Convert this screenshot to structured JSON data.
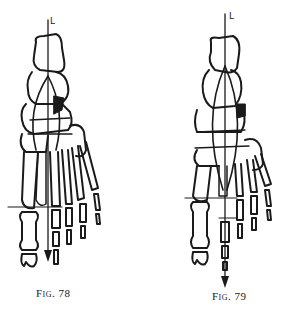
{
  "figures": [
    {
      "id": "left",
      "caption": "Fig. 78",
      "axis_label": "L",
      "subject": "foot-skeleton-dorsal-view"
    },
    {
      "id": "right",
      "caption": "Fig. 79",
      "axis_label": "L",
      "subject": "foot-skeleton-dorsal-view"
    }
  ],
  "colors": {
    "ink": "#1a1a1a",
    "paper": "#ffffff"
  }
}
